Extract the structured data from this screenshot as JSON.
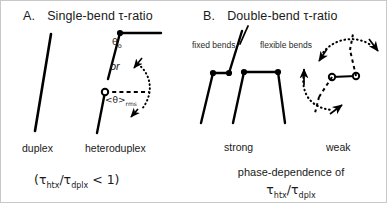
{
  "figure": {
    "width": 387,
    "height": 203,
    "background": "#ffffff",
    "border_color": "#c8c8c8",
    "ink_color": "#000000"
  },
  "panel_a": {
    "letter": "A.",
    "title": "Single-bend τ-ratio",
    "title_plain": "A.  Single-bend τ-ratio",
    "theta_label": "θ",
    "theta_subscript": "o",
    "or_label": "or",
    "rms_label": "<θ>",
    "rms_subscript": "rms",
    "left_structure_label": "duplex",
    "right_structure_label": "heteroduplex",
    "formula_open": "(",
    "formula_tau1": "τ",
    "formula_sub1": "htx",
    "formula_slash": "/",
    "formula_tau2": "τ",
    "formula_sub2": "dplx",
    "formula_tail": " < 1)",
    "formula_plain": "(τhtx/τdplx < 1)"
  },
  "panel_b": {
    "letter": "B.",
    "title": "Double-bend τ-ratio",
    "title_plain": "B.  Double-bend τ-ratio",
    "fixed_bends_label": "fixed bends",
    "flexible_bends_label": "flexible bends",
    "strong_label": "strong",
    "weak_label": "weak",
    "caption_line1": "phase-dependence of",
    "caption_tau1": "τ",
    "caption_sub1": "htx",
    "caption_slash": "/",
    "caption_tau2": "τ",
    "caption_sub2": "dplx",
    "caption_plain": "phase-dependence of τhtx/τdplx"
  },
  "icons": {
    "rod_segment": "rod-line",
    "bend_joint_filled": "filled-circle-joint",
    "bend_joint_open": "open-circle-joint",
    "motion_arc": "dotted-arc-arrow",
    "dashed_axis": "dashed-reference-line"
  }
}
